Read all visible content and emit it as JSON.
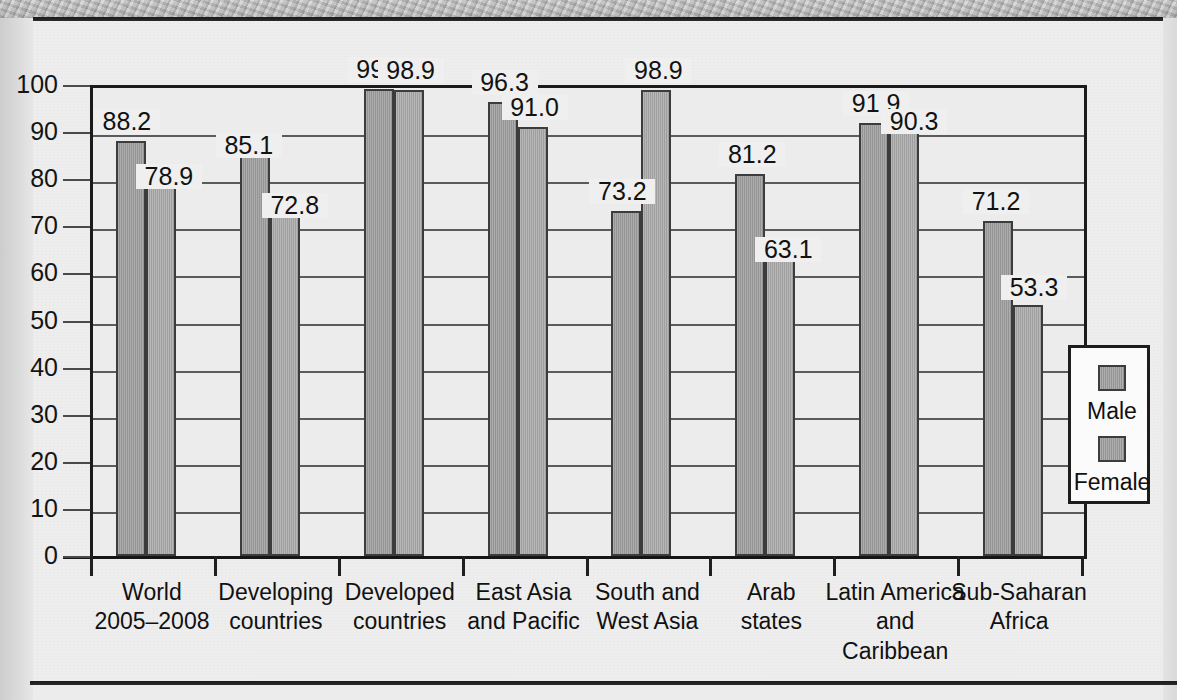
{
  "chart_data": {
    "type": "bar",
    "title": "",
    "xlabel": "",
    "ylabel": "",
    "ylim": [
      0,
      100
    ],
    "yticks": [
      0,
      10,
      20,
      30,
      40,
      50,
      60,
      70,
      80,
      90,
      100
    ],
    "grid": true,
    "legend_position": "right-inside",
    "categories": [
      "World\n2005–2008",
      "Developing\ncountries",
      "Developed\ncountries",
      "East Asia\nand Pacific",
      "South and\nWest Asia",
      "Arab\nstates",
      "Latin America\nand\nCaribbean",
      "Sub-Saharan\nAfrica"
    ],
    "category_lines": [
      [
        "World",
        "2005–2008"
      ],
      [
        "Developing",
        "countries"
      ],
      [
        "Developed",
        "countries"
      ],
      [
        "East Asia",
        "and Pacific"
      ],
      [
        "South and",
        "West Asia"
      ],
      [
        "Arab",
        "states"
      ],
      [
        "Latin America",
        "and",
        "Caribbean"
      ],
      [
        "Sub-Saharan",
        "Africa"
      ]
    ],
    "series": [
      {
        "name": "Male",
        "values": [
          88.2,
          85.1,
          99.2,
          96.3,
          73.2,
          81.2,
          91.9,
          71.2
        ]
      },
      {
        "name": "Female",
        "values": [
          78.9,
          72.8,
          98.9,
          91.0,
          98.9,
          63.1,
          90.3,
          53.3
        ]
      }
    ],
    "value_labels": [
      "88.2",
      "78.9",
      "85.1",
      "72.8",
      "99.2",
      "98.9",
      "96.3",
      "91.0",
      "73.2",
      "98.9",
      "81.2",
      "63.1",
      "91.9",
      "90.3",
      "71.2",
      "53.3"
    ],
    "colors": {
      "male_bar": "#9c9c9c",
      "female_bar": "#a5a5a5",
      "bar_outline": "#3c3c3c",
      "axis": "#1b1b1b",
      "gridline": "#5b5b5b",
      "plot_background": "#ececec",
      "paper": "#eeeeee"
    }
  },
  "legend": {
    "items": [
      {
        "label": "Male"
      },
      {
        "label": "Female"
      }
    ]
  },
  "axis": {
    "y_tick_labels": [
      "100",
      "90",
      "80",
      "70",
      "60",
      "50",
      "40",
      "30",
      "20",
      "10",
      "0"
    ]
  }
}
